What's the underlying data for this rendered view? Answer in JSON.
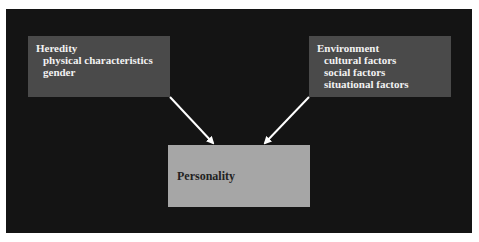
{
  "diagram": {
    "type": "flow",
    "nodes": {
      "heredity": {
        "title": "Heredity",
        "items": [
          "physical characteristics",
          "gender"
        ]
      },
      "environment": {
        "title": "Environment",
        "items": [
          "cultural factors",
          "social factors",
          "situational factors"
        ]
      },
      "personality": {
        "title": "Personality"
      }
    },
    "edges": [
      {
        "from": "Heredity",
        "to": "Personality"
      },
      {
        "from": "Environment",
        "to": "Personality"
      }
    ],
    "colors": {
      "background": "#141414",
      "input_box": "#4a4a4a",
      "output_box": "#a6a6a6",
      "arrow": "#ffffff"
    }
  }
}
